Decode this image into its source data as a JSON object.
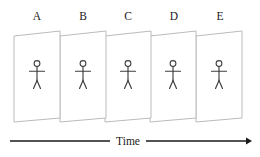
{
  "diagram": {
    "background_color": "#ffffff",
    "panel_stroke_color": "#b3b3b3",
    "figure_stroke_color": "#3d3d3d",
    "axis_color": "#1a1a1a",
    "frames": [
      {
        "label": "A",
        "label_x": 37,
        "x": 14,
        "icon": "stick-figure-icon"
      },
      {
        "label": "B",
        "label_x": 83,
        "x": 60,
        "icon": "stick-figure-icon"
      },
      {
        "label": "C",
        "label_x": 128,
        "x": 105,
        "icon": "stick-figure-icon"
      },
      {
        "label": "D",
        "label_x": 174,
        "x": 150,
        "icon": "stick-figure-icon"
      },
      {
        "label": "E",
        "label_x": 220,
        "x": 196,
        "icon": "stick-figure-icon"
      }
    ],
    "axis": {
      "label": "Time",
      "label_x": 128,
      "label_y": 145,
      "direction": "left-to-right",
      "arrow_icon": "arrow-right-icon",
      "left_segment_x1": 10,
      "left_segment_x2": 110,
      "right_segment_x1": 146,
      "right_segment_x2": 250,
      "y": 141
    }
  }
}
